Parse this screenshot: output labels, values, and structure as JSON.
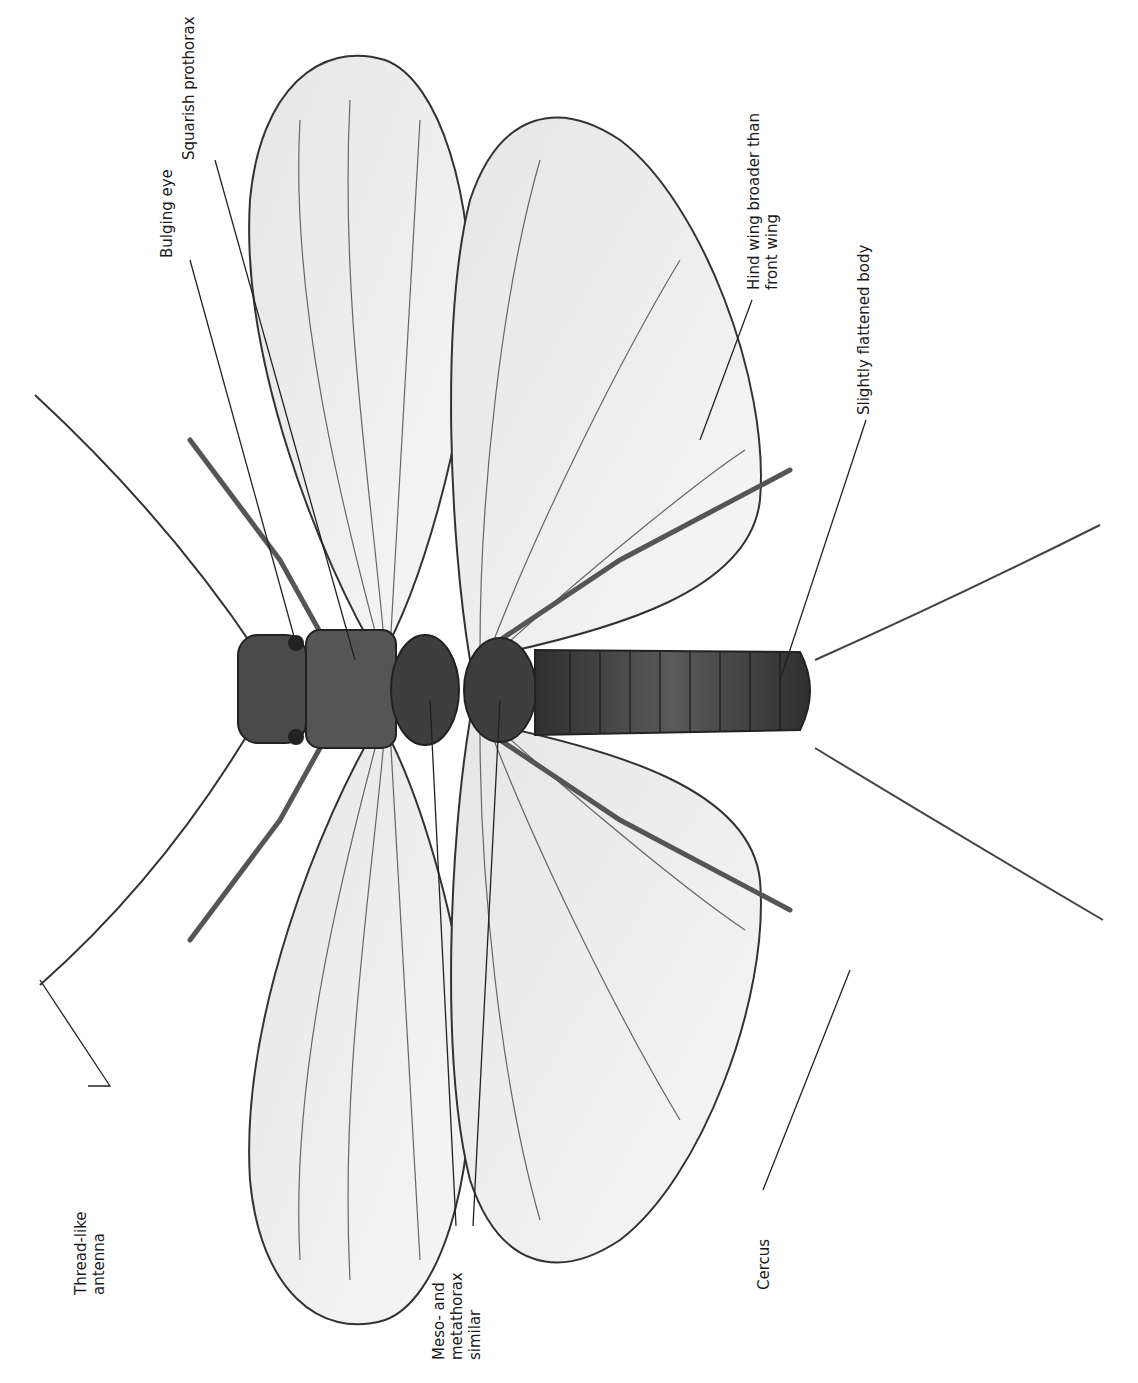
{
  "figure": {
    "labels": [
      {
        "id": "thread-like-antenna",
        "lines": [
          "Thread-like",
          "antenna"
        ]
      },
      {
        "id": "bulging-eye",
        "lines": [
          "Bulging eye"
        ]
      },
      {
        "id": "squarish-prothorax",
        "lines": [
          "Squarish prothorax"
        ]
      },
      {
        "id": "meso-metathorax",
        "lines": [
          "Meso- and",
          "metathorax",
          "similar"
        ]
      },
      {
        "id": "hind-wing",
        "lines": [
          "Hind wing broader than",
          "front wing"
        ]
      },
      {
        "id": "flattened-body",
        "lines": [
          "Slightly flattened body"
        ]
      },
      {
        "id": "cercus",
        "lines": [
          "Cercus"
        ]
      }
    ]
  },
  "colors": {
    "background": "#ffffff",
    "line": "#222222",
    "wing_fill": "#ececec",
    "vein": "#555555",
    "body": "#3a3a3a"
  }
}
